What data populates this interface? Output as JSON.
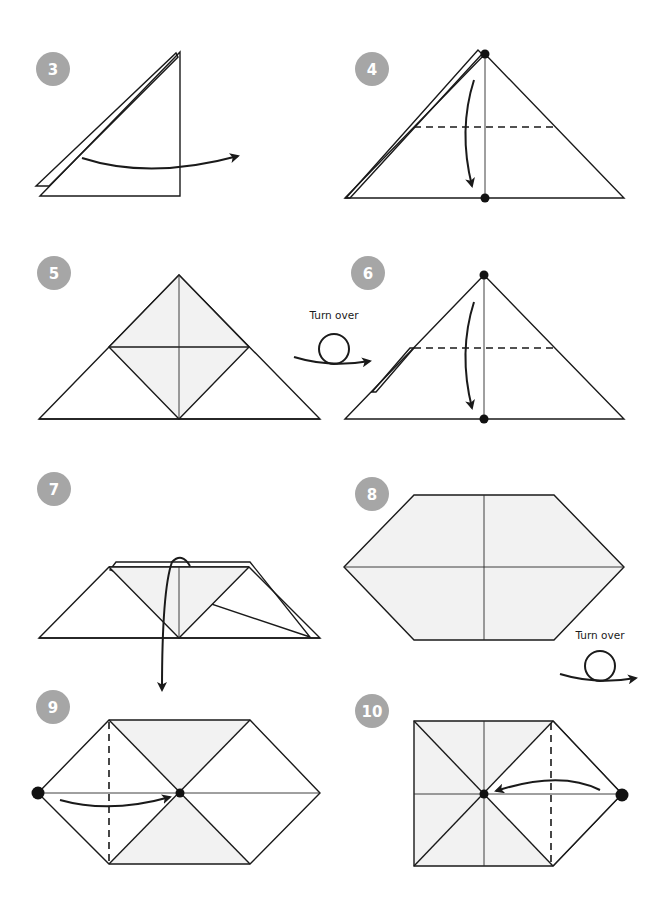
{
  "diagram": {
    "type": "origami-instructions",
    "colors": {
      "line": "#1a1a1a",
      "badge": "#a6a6a6",
      "badge_text": "#ffffff",
      "shade": "#f2f2f2",
      "background": "#ffffff"
    },
    "steps": [
      {
        "number": "3",
        "description": "Folded triangle with layers, arrow pointing right"
      },
      {
        "number": "4",
        "description": "Triangle with dashed fold line; fold top point down to bottom dot"
      },
      {
        "number": "5",
        "description": "Triangle with shaded inner square"
      },
      {
        "number": "6",
        "description": "Turned-over triangle with dashed fold line; fold top point down"
      },
      {
        "number": "7",
        "description": "Trapezoid, fold top layer down"
      },
      {
        "number": "8",
        "description": "Shaded hexagon with center crease lines"
      },
      {
        "number": "9",
        "description": "Hexagon; fold left point to center along dashed line"
      },
      {
        "number": "10",
        "description": "Square with right point; fold right point to center"
      }
    ],
    "annotations": [
      {
        "id": "turn-over-1",
        "text": "Turn over"
      },
      {
        "id": "turn-over-2",
        "text": "Turn over"
      }
    ]
  }
}
